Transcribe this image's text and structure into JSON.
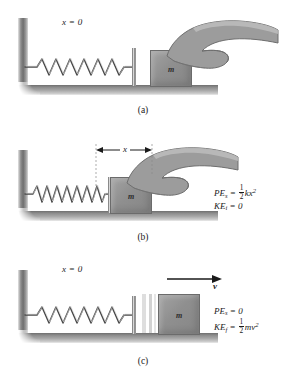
{
  "figure": {
    "panels": [
      {
        "id": "a",
        "caption": "(a)",
        "origin_label": "x = 0",
        "block_label": "m",
        "state": "spring relaxed, hand on block at x = 0",
        "equations": []
      },
      {
        "id": "b",
        "caption": "(b)",
        "dimension_label": "x",
        "block_label": "m",
        "state": "spring compressed a distance x by the hand",
        "equations": [
          {
            "name": "spring-potential-energy",
            "lhs": "PE",
            "lhs_sub": "s",
            "rel": "=",
            "rhs_fraction": {
              "num": "1",
              "den": "2"
            },
            "rhs_rest": "kx",
            "rhs_exp": "2"
          },
          {
            "name": "initial-kinetic-energy",
            "lhs": "KE",
            "lhs_sub": "i",
            "rel": "=",
            "rhs_plain": "0"
          }
        ]
      },
      {
        "id": "c",
        "caption": "(c)",
        "origin_label": "x = 0",
        "block_label": "m",
        "velocity_label": "v",
        "state": "spring released, block moves right with velocity v",
        "equations": [
          {
            "name": "spring-potential-energy",
            "lhs": "PE",
            "lhs_sub": "s",
            "rel": "=",
            "rhs_plain": "0"
          },
          {
            "name": "final-kinetic-energy",
            "lhs": "KE",
            "lhs_sub": "f",
            "rel": "=",
            "rhs_fraction": {
              "num": "1",
              "den": "2"
            },
            "rhs_rest": "mv",
            "rhs_exp": "2"
          }
        ]
      }
    ]
  },
  "colors": {
    "background": "#ffffff",
    "wall_dark": "#6f6f6f",
    "ground_dark": "#6e6e6e",
    "block_fill": "#8f8f8f",
    "spring_stroke": "#4a4a4a",
    "hand_fill": "#9c9c9c",
    "text": "#1a1a1a",
    "streak": "#d9d9d9"
  }
}
